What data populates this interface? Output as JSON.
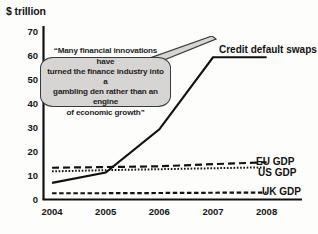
{
  "chart_data": {
    "type": "line",
    "title": "",
    "ylabel": "$ trillion",
    "xlabel": "",
    "x": [
      2004,
      2005,
      2006,
      2007,
      2008
    ],
    "xticklabels": [
      "2004",
      "2005",
      "2006",
      "2007",
      "2008"
    ],
    "yticklabels": [
      "0",
      "10",
      "20",
      "30",
      "40",
      "50",
      "60",
      "70"
    ],
    "yticks": [
      0,
      10,
      20,
      30,
      40,
      50,
      60,
      70
    ],
    "ylim": [
      0,
      72
    ],
    "xlim": [
      2003.85,
      2008.1
    ],
    "grid": false,
    "legend_position": "right-inline-labels",
    "series": [
      {
        "name": "Credit default swaps",
        "style": "solid",
        "color": "#111111",
        "values": [
          6.7,
          11.0,
          29.0,
          59.0,
          59.0
        ]
      },
      {
        "name": "EU GDP",
        "style": "dashed",
        "color": "#111111",
        "values": [
          13.0,
          13.3,
          13.6,
          14.5,
          15.3
        ]
      },
      {
        "name": "US GDP",
        "style": "dotted",
        "color": "#111111",
        "values": [
          11.5,
          12.0,
          12.4,
          12.8,
          13.2
        ]
      },
      {
        "name": "UK GDP",
        "style": "dashed-small",
        "color": "#111111",
        "values": [
          2.4,
          2.4,
          2.5,
          2.6,
          2.7
        ]
      }
    ],
    "annotations": [
      {
        "name": "quote-callout",
        "text": "“Many financial innovations have turned the finance industry into a gambling den rather than an engine of economic growth”",
        "lines": [
          "“Many financial innovations have",
          "turned the finance industry into a",
          "gambling den rather than an engine",
          "of economic growth”"
        ],
        "fill": "#d6d5d3",
        "stroke": "#3a3a3a"
      }
    ]
  },
  "labels": {
    "cds": "Credit default swaps",
    "eu": "EU GDP",
    "us": "US GDP",
    "uk": "UK GDP"
  },
  "colors": {
    "axis": "#111111",
    "line": "#111111",
    "callout_fill": "#d6d5d3",
    "callout_stroke": "#3a3a3a",
    "background": "#fdfdfc"
  }
}
